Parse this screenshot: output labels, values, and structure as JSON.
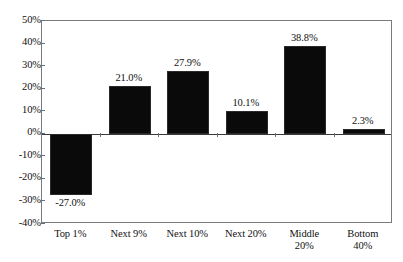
{
  "chart_data": {
    "type": "bar",
    "title": "",
    "subtitle": "",
    "xlabel": "",
    "ylabel": "",
    "categories": [
      "Top 1%",
      "Next 9%",
      "Next 10%",
      "Next 20%",
      "Middle 20%",
      "Bottom 40%"
    ],
    "category_lines": [
      [
        "Top 1%"
      ],
      [
        "Next 9%"
      ],
      [
        "Next 10%"
      ],
      [
        "Next 20%"
      ],
      [
        "Middle",
        "20%"
      ],
      [
        "Bottom",
        "40%"
      ]
    ],
    "values": [
      -27.0,
      21.0,
      27.9,
      10.1,
      38.8,
      2.3
    ],
    "data_labels": [
      "-27.0%",
      "21.0%",
      "27.9%",
      "10.1%",
      "38.8%",
      "2.3%"
    ],
    "ylim": [
      -40,
      50
    ],
    "ytick_values": [
      50,
      40,
      30,
      20,
      10,
      0,
      -10,
      -20,
      -30,
      -40
    ],
    "ytick_labels": [
      "50%",
      "40%",
      "30%",
      "20%",
      "10%",
      "0%",
      "-10%",
      "-20%",
      "-30%",
      "-40%"
    ],
    "grid": false,
    "legend": null,
    "bar_color": "#0a0a0a",
    "axis_color": "#7a7a7a",
    "background": "#ffffff"
  }
}
